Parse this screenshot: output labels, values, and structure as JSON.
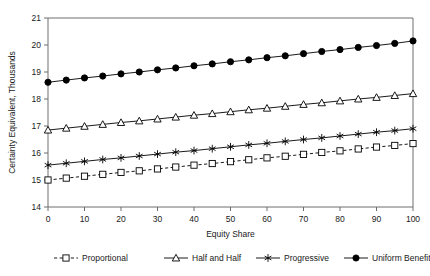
{
  "chart_data": {
    "type": "line",
    "title": "",
    "xlabel": "Equity Share",
    "ylabel": "Certainty Equivalent, Thousands",
    "xlim": [
      0,
      100
    ],
    "ylim": [
      14,
      21
    ],
    "xticks": [
      0,
      10,
      20,
      30,
      40,
      50,
      60,
      70,
      80,
      90,
      100
    ],
    "yticks": [
      14,
      15,
      16,
      17,
      18,
      19,
      20,
      21
    ],
    "grid": false,
    "legend_position": "bottom",
    "x": [
      0,
      5,
      10,
      15,
      20,
      25,
      30,
      35,
      40,
      45,
      50,
      55,
      60,
      65,
      70,
      75,
      80,
      85,
      90,
      95,
      100
    ],
    "series": [
      {
        "name": "Proportional",
        "marker": "open-square",
        "linestyle": "dashed",
        "color": "#000000",
        "values": [
          15.0,
          15.07,
          15.14,
          15.21,
          15.28,
          15.34,
          15.41,
          15.48,
          15.55,
          15.61,
          15.68,
          15.75,
          15.82,
          15.88,
          15.95,
          16.02,
          16.08,
          16.15,
          16.22,
          16.28,
          16.35
        ]
      },
      {
        "name": "Half and Half",
        "marker": "open-triangle",
        "linestyle": "solid",
        "color": "#000000",
        "values": [
          16.85,
          16.92,
          16.99,
          17.06,
          17.13,
          17.19,
          17.26,
          17.33,
          17.4,
          17.46,
          17.53,
          17.6,
          17.66,
          17.73,
          17.8,
          17.86,
          17.93,
          18.0,
          18.06,
          18.13,
          18.2
        ]
      },
      {
        "name": "Progressive",
        "marker": "asterisk",
        "linestyle": "solid",
        "color": "#000000",
        "values": [
          15.55,
          15.62,
          15.69,
          15.76,
          15.82,
          15.89,
          15.96,
          16.03,
          16.09,
          16.16,
          16.23,
          16.3,
          16.36,
          16.43,
          16.5,
          16.56,
          16.63,
          16.7,
          16.77,
          16.83,
          16.9
        ]
      },
      {
        "name": "Uniform Benefit",
        "marker": "filled-circle",
        "linestyle": "solid",
        "color": "#000000",
        "values": [
          18.62,
          18.7,
          18.78,
          18.85,
          18.93,
          19.0,
          19.08,
          19.15,
          19.23,
          19.3,
          19.38,
          19.45,
          19.53,
          19.6,
          19.68,
          19.76,
          19.83,
          19.91,
          19.98,
          20.06,
          20.15
        ]
      }
    ],
    "legend": [
      {
        "label": "Proportional",
        "marker": "open-square",
        "linestyle": "dashed"
      },
      {
        "label": "Half and Half",
        "marker": "open-triangle",
        "linestyle": "solid"
      },
      {
        "label": "Progressive",
        "marker": "asterisk",
        "linestyle": "solid"
      },
      {
        "label": "Uniform Benefit",
        "marker": "filled-circle",
        "linestyle": "solid"
      }
    ]
  },
  "axis": {
    "y_title": "Certainty Equivalent, Thousands",
    "x_title": "Equity Share",
    "y_tick_labels": [
      "21",
      "20",
      "19",
      "18",
      "17",
      "16",
      "15",
      "14"
    ],
    "x_tick_labels": [
      "0",
      "10",
      "20",
      "30",
      "40",
      "50",
      "60",
      "70",
      "80",
      "90",
      "100"
    ]
  },
  "legend_labels": {
    "proportional": "Proportional",
    "half_and_half": "Half and Half",
    "progressive": "Progressive",
    "uniform_benefit": "Uniform Benefit"
  },
  "colors": {
    "ink": "#000000",
    "axis": "#6e6e6e",
    "background": "#ffffff"
  }
}
